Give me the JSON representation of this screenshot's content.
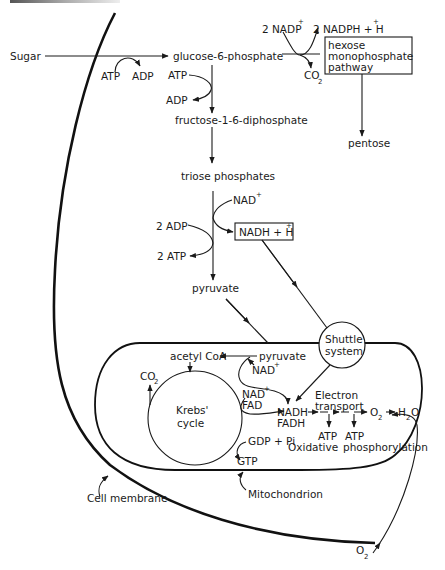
{
  "diagram": {
    "type": "metabolic-pathway"
  },
  "labels": {
    "sugar": "Sugar",
    "atp_1": "ATP",
    "adp_1": "ADP",
    "glucose_6_phosphate": "glucose-6-phosphate",
    "nadp": "2 NADP",
    "nadp_sup": "+",
    "nadph": "2 NADPH + H",
    "nadph_sup": "+",
    "co2_top": "CO",
    "co2_top_sub": "2",
    "hmp_line1": "hexose",
    "hmp_line2": "monophosphate",
    "hmp_line3": "pathway",
    "pentose": "pentose",
    "atp_2": "ATP",
    "adp_2": "ADP",
    "fructose": "fructose-1-6-diphosphate",
    "triose": "triose phosphates",
    "nad_1": "NAD",
    "nad_1_sup": "+",
    "adp_3": "2 ADP",
    "nadh_box": "NADH + H",
    "nadh_box_sup": "+",
    "atp_3": "2 ATP",
    "pyruvate_1": "pyruvate",
    "shuttle_line1": "Shuttle",
    "shuttle_line2": "system",
    "acetyl_coa": "acetyl CoA",
    "pyruvate_2": "pyruvate",
    "nad_2": "NAD",
    "nad_2_sup": "+",
    "co2_krebs": "CO",
    "co2_krebs_sub": "2",
    "krebs_line1": "Krebs'",
    "krebs_line2": "cycle",
    "nad_3": "NAD",
    "nad_3_sup": "+",
    "fad": "FAD",
    "nadh": "NADH",
    "fadh": "FADH",
    "electron_line1": "Electron",
    "electron_line2": "transport",
    "o2_mito": "O",
    "o2_mito_sub": "2",
    "h2o_h": "H",
    "h2o_sub": "2",
    "h2o_o": "O",
    "gdp": "GDP + Pi",
    "gtp": "GTP",
    "atp_4": "ATP",
    "atp_5": "ATP",
    "oxidative": "Oxidative",
    "phosphorylation": "phosphorylation",
    "cell_membrane": "Cell membrane",
    "mitochondrion": "Mitochondrion",
    "o2_bottom": "O",
    "o2_bottom_sub": "2"
  },
  "colors": {
    "ink": "#1a1a1a",
    "background": "#ffffff"
  }
}
